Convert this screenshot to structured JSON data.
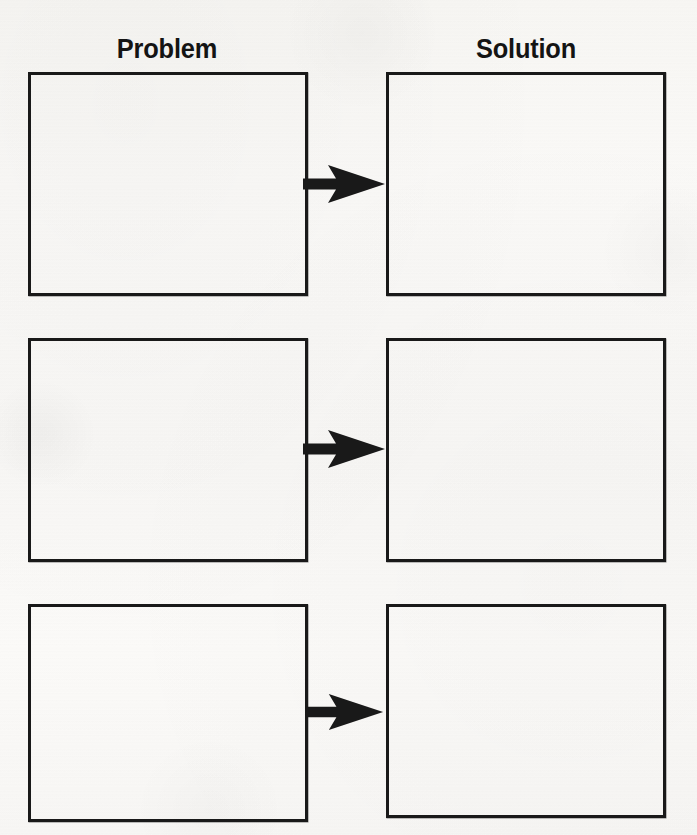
{
  "worksheet": {
    "title": "Problem and Solution Graphic Organizer",
    "background_color": "#f8f7f5",
    "ink_color": "#191919",
    "columns": [
      {
        "id": "problem",
        "heading": "Problem"
      },
      {
        "id": "solution",
        "heading": "Solution"
      }
    ],
    "rows": [
      {
        "index": 1,
        "problem_box": {
          "value": "",
          "placeholder": ""
        },
        "arrow": {
          "icon": "right-arrow-icon",
          "direction": "right"
        },
        "solution_box": {
          "value": "",
          "placeholder": ""
        }
      },
      {
        "index": 2,
        "problem_box": {
          "value": "",
          "placeholder": ""
        },
        "arrow": {
          "icon": "right-arrow-icon",
          "direction": "right"
        },
        "solution_box": {
          "value": "",
          "placeholder": ""
        }
      },
      {
        "index": 3,
        "problem_box": {
          "value": "",
          "placeholder": ""
        },
        "arrow": {
          "icon": "right-arrow-icon",
          "direction": "right"
        },
        "solution_box": {
          "value": "",
          "placeholder": ""
        }
      }
    ]
  }
}
